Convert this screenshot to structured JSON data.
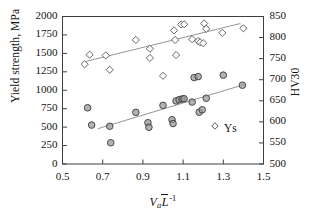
{
  "chart_data": {
    "type": "scatter",
    "title": "",
    "xlabel": "Va L-1",
    "xlabel_parts": {
      "symbol": "V",
      "subscript": "a",
      "second_symbol": "L",
      "superscript": "-1"
    },
    "ylabel": "Yield strength, MPa",
    "ylabel_right": "HV30",
    "xlim": [
      0.5,
      1.5
    ],
    "ylim": [
      0,
      2000
    ],
    "ylim_right": [
      500,
      850
    ],
    "xticks": [
      "0.5",
      "0.7",
      "0.9",
      "1.1",
      "1.3",
      "1.5"
    ],
    "xtick_values": [
      0.5,
      0.7,
      0.9,
      1.1,
      1.3,
      1.5
    ],
    "yticks": [
      "0",
      "250",
      "500",
      "750",
      "1000",
      "1250",
      "1500",
      "1750",
      "2000"
    ],
    "ytick_values": [
      0,
      250,
      500,
      750,
      1000,
      1250,
      1500,
      1750,
      2000
    ],
    "yticks_right": [
      "500",
      "550",
      "600",
      "650",
      "700",
      "750",
      "800",
      "850"
    ],
    "ytick_right_values": [
      500,
      550,
      600,
      650,
      700,
      750,
      800,
      850
    ],
    "grid": false,
    "legend_position": "inside-lower-right",
    "legend": [
      {
        "label": "Ys",
        "marker": "diamond",
        "fill": "#ffffff",
        "stroke": "#4d4d4d"
      }
    ],
    "series": [
      {
        "name": "HV30",
        "marker": "diamond",
        "axis": "right",
        "fill": "#ffffff",
        "stroke": "#555555",
        "points": [
          [
            0.61,
            1352
          ],
          [
            0.635,
            1482
          ],
          [
            0.715,
            1472
          ],
          [
            0.735,
            1278
          ],
          [
            0.865,
            1682
          ],
          [
            0.935,
            1562
          ],
          [
            0.935,
            1438
          ],
          [
            1.0,
            1196
          ],
          [
            1.055,
            1812
          ],
          [
            1.06,
            1682
          ],
          [
            1.065,
            1478
          ],
          [
            1.09,
            1892
          ],
          [
            1.105,
            1895
          ],
          [
            1.145,
            1692
          ],
          [
            1.175,
            1668
          ],
          [
            1.185,
            1650
          ],
          [
            1.2,
            1638
          ],
          [
            1.205,
            1905
          ],
          [
            1.215,
            1832
          ],
          [
            1.295,
            1778
          ],
          [
            1.4,
            1840
          ]
        ]
      },
      {
        "name": "Ys",
        "marker": "circle",
        "axis": "left",
        "fill": "#9a9a9a",
        "stroke": "#3a3a3a",
        "points": [
          [
            0.625,
            762
          ],
          [
            0.645,
            528
          ],
          [
            0.735,
            512
          ],
          [
            0.74,
            288
          ],
          [
            0.865,
            700
          ],
          [
            0.925,
            560
          ],
          [
            0.93,
            498
          ],
          [
            1.0,
            795
          ],
          [
            1.045,
            600
          ],
          [
            1.05,
            548
          ],
          [
            1.065,
            855
          ],
          [
            1.08,
            872
          ],
          [
            1.095,
            882
          ],
          [
            1.105,
            885
          ],
          [
            1.145,
            840
          ],
          [
            1.155,
            1172
          ],
          [
            1.175,
            1185
          ],
          [
            1.18,
            702
          ],
          [
            1.195,
            735
          ],
          [
            1.215,
            892
          ],
          [
            1.3,
            1205
          ],
          [
            1.395,
            1068
          ]
        ]
      }
    ],
    "trendlines": [
      {
        "name": "HV30-trend",
        "series": "HV30",
        "axis": "left",
        "x0": 0.6,
        "y0": 1380,
        "x1": 1.385,
        "y1": 1905,
        "color": "#8a8a8a"
      },
      {
        "name": "Ys-trend",
        "series": "Ys",
        "axis": "left",
        "x0": 0.675,
        "y0": 478,
        "x1": 1.405,
        "y1": 1078,
        "color": "#8a8a8a"
      }
    ]
  }
}
